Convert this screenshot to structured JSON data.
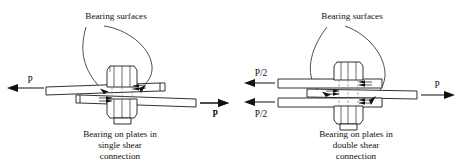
{
  "figure": {
    "title_text": "Bearing on plates in single and double shear connections",
    "background_color": "#ffffff",
    "line_color": "#1a1a1a",
    "text_color": "#111111"
  },
  "left_diagram": {
    "name": "single-shear-connection",
    "callout_label": "Bearing surfaces",
    "left_force_label": "P",
    "right_force_label": "P",
    "caption_line1": "Bearing on plates in",
    "caption_line2": "single shear",
    "caption_line3": "connection",
    "plate_count": 2,
    "bolt_label": "hex bolt and nut",
    "bearing_arrow_groups": 2
  },
  "right_diagram": {
    "name": "double-shear-connection",
    "callout_label": "Bearing surfaces",
    "left_force_label_top": "P/2",
    "left_force_label_bottom": "P/2",
    "right_force_label": "P",
    "caption_line1": "Bearing on plates in",
    "caption_line2": "double shear",
    "caption_line3": "connection",
    "plate_count": 3,
    "bolt_label": "hex bolt and nut",
    "bearing_arrow_groups": 3
  },
  "middle": {
    "force_label": "P"
  }
}
